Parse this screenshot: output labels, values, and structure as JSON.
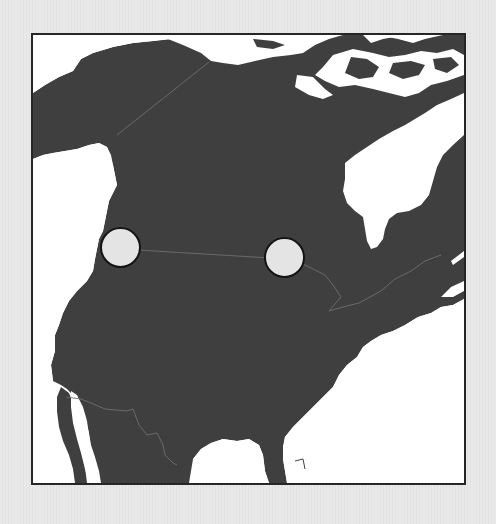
{
  "map": {
    "land_color": "#3f3f3f",
    "water_color": "#ffffff",
    "border_color": "#6e6e6e",
    "frame_color": "#262626",
    "page_background": "#e6e6e6"
  },
  "markers": [
    {
      "id": "marker-west",
      "cx": 122,
      "cy": 249,
      "r": 22,
      "fill": "#e4e4e4"
    },
    {
      "id": "marker-east",
      "cx": 286,
      "cy": 259,
      "r": 22,
      "fill": "#e4e4e4"
    }
  ]
}
